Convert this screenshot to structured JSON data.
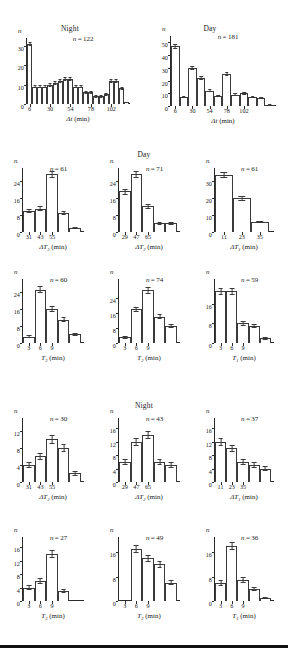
{
  "figure": {
    "section_headers": [
      {
        "label": "Night",
        "row": 1,
        "side": "left"
      },
      {
        "label": "Day",
        "row": 1,
        "side": "right"
      },
      {
        "label": "Day",
        "row": 2
      },
      {
        "label": "Night",
        "row": 4
      }
    ],
    "axis_n_symbol": "n",
    "minutes_unit": "(min)"
  },
  "chart_data": [
    {
      "id": "r1c1",
      "type": "bar",
      "title": "Night",
      "n_label": "n = 122",
      "n_value": 122,
      "xlabel": "Δt (min)",
      "ylabel": "n",
      "ylim": [
        0,
        34
      ],
      "yticks": [
        0,
        10,
        20,
        30
      ],
      "xticks": [
        6,
        30,
        54,
        78,
        102
      ],
      "bin_count": 13,
      "categories": [
        "6",
        "12",
        "18",
        "24",
        "30",
        "36",
        "42",
        "48",
        "54",
        "60",
        "66",
        "72",
        "78",
        "84",
        "90",
        "96",
        "102",
        "108",
        "114"
      ],
      "values": [
        31,
        9,
        9,
        9,
        10,
        11,
        12,
        13,
        13,
        9,
        9,
        6,
        6,
        4,
        4,
        5,
        12,
        12,
        8,
        1
      ],
      "errors": [
        1.2,
        0.8,
        0.8,
        0.8,
        0.9,
        0.9,
        1.0,
        1.0,
        1.0,
        0.9,
        0.9,
        0.7,
        0.7,
        0.6,
        0.6,
        0.7,
        1.0,
        1.0,
        0.9,
        0.3
      ],
      "grid": false
    },
    {
      "id": "r1c2",
      "type": "bar",
      "title": "Day",
      "n_label": "n = 181",
      "n_value": 181,
      "xlabel": "Δt (min)",
      "ylabel": "n",
      "ylim": [
        0,
        55
      ],
      "yticks": [
        0,
        10,
        20,
        30,
        40,
        50
      ],
      "xticks": [
        6,
        30,
        54,
        78,
        102
      ],
      "bin_count": 11,
      "categories": [
        "6",
        "18",
        "30",
        "42",
        "54",
        "66",
        "78",
        "90",
        "102",
        "114",
        "126"
      ],
      "values": [
        47,
        7,
        30,
        22,
        12,
        8,
        25,
        9,
        10,
        7,
        6,
        1
      ],
      "errors": [
        2.0,
        0.8,
        1.6,
        1.4,
        1.0,
        0.8,
        1.5,
        0.9,
        1.0,
        0.8,
        0.7,
        0.3
      ],
      "grid": false
    },
    {
      "id": "r2c1",
      "type": "bar",
      "title": "",
      "n_label": "n = 61",
      "n_value": 61,
      "xlabel": "ΔT₃ (min)",
      "ylabel": "n",
      "ylim": [
        0,
        30
      ],
      "yticks": [
        0,
        8,
        16,
        24
      ],
      "xticks": [
        31,
        43,
        55
      ],
      "bin_count": 5,
      "categories": [
        "31",
        "43",
        "55",
        "67",
        "79"
      ],
      "values": [
        10,
        11,
        27,
        9,
        2
      ],
      "errors": [
        1.0,
        1.1,
        1.6,
        1.0,
        0.5
      ],
      "grid": false
    },
    {
      "id": "r2c2",
      "type": "bar",
      "title": "Day",
      "n_label": "n = 71",
      "n_value": 71,
      "xlabel": "ΔT₂ (min)",
      "ylabel": "n",
      "ylim": [
        0,
        30
      ],
      "yticks": [
        0,
        8,
        16,
        24
      ],
      "xticks": [
        29,
        47,
        65
      ],
      "bin_count": 5,
      "categories": [
        "29",
        "47",
        "65",
        "83",
        "101"
      ],
      "values": [
        19,
        27,
        12,
        4,
        4
      ],
      "errors": [
        1.4,
        1.7,
        1.1,
        0.6,
        0.6
      ],
      "grid": false
    },
    {
      "id": "r2c3",
      "type": "bar",
      "title": "",
      "n_label": "n = 61",
      "n_value": 61,
      "xlabel": "ΔT₁ (min)",
      "ylabel": "n",
      "ylim": [
        0,
        38
      ],
      "yticks": [
        0,
        10,
        20,
        30
      ],
      "xticks": [
        11,
        23,
        35
      ],
      "bin_count": 3,
      "categories": [
        "11",
        "23",
        "35"
      ],
      "values": [
        34,
        20,
        6
      ],
      "errors": [
        1.8,
        1.4,
        0.8
      ],
      "grid": false
    },
    {
      "id": "r3c1",
      "type": "bar",
      "title": "",
      "n_label": "n = 60",
      "n_value": 60,
      "xlabel": "T₃ (min)",
      "ylabel": "n",
      "ylim": [
        0,
        30
      ],
      "yticks": [
        0,
        8,
        16,
        24
      ],
      "xticks": [
        3,
        6,
        9
      ],
      "bin_count": 5,
      "categories": [
        "3",
        "6",
        "9",
        "12",
        "15"
      ],
      "values": [
        3,
        25,
        16,
        11,
        4
      ],
      "errors": [
        0.6,
        1.6,
        1.2,
        1.1,
        0.7
      ],
      "grid": false
    },
    {
      "id": "r3c2",
      "type": "bar",
      "title": "",
      "n_label": "n = 74",
      "n_value": 74,
      "xlabel": "T₂ (min)",
      "ylabel": "n",
      "ylim": [
        0,
        34
      ],
      "yticks": [
        0,
        8,
        16,
        24
      ],
      "xticks": [
        3,
        6,
        9
      ],
      "bin_count": 5,
      "categories": [
        "3",
        "6",
        "9",
        "12",
        "15"
      ],
      "values": [
        3,
        18,
        28,
        14,
        9
      ],
      "errors": [
        0.6,
        1.3,
        1.7,
        1.2,
        1.0
      ],
      "grid": false
    },
    {
      "id": "r3c3",
      "type": "bar",
      "title": "",
      "n_label": "n = 59",
      "n_value": 59,
      "xlabel": "T₁ (min)",
      "ylabel": "n",
      "ylim": [
        0,
        26
      ],
      "yticks": [
        0,
        8,
        16
      ],
      "xticks": [
        3,
        6,
        9
      ],
      "bin_count": 5,
      "categories": [
        "3",
        "6",
        "9",
        "12",
        "15"
      ],
      "values": [
        21,
        21,
        8,
        7,
        2
      ],
      "errors": [
        1.4,
        1.4,
        0.9,
        0.9,
        0.5
      ],
      "grid": false
    },
    {
      "id": "r4c1",
      "type": "bar",
      "title": "Night",
      "n_label": "n = 30",
      "n_value": 30,
      "xlabel": "ΔT₃ (min)",
      "ylabel": "n",
      "ylim": [
        0,
        15
      ],
      "yticks": [
        0,
        4,
        8,
        12
      ],
      "xticks": [
        31,
        43,
        55
      ],
      "bin_count": 5,
      "categories": [
        "31",
        "43",
        "55",
        "67",
        "79"
      ],
      "values": [
        4,
        6,
        10,
        8,
        2
      ],
      "errors": [
        0.7,
        0.9,
        1.1,
        1.0,
        0.5
      ],
      "grid": false
    },
    {
      "id": "r4c2",
      "type": "bar",
      "title": "",
      "n_label": "n = 43",
      "n_value": 43,
      "xlabel": "ΔT₂ (min)",
      "ylabel": "n",
      "ylim": [
        0,
        19
      ],
      "yticks": [
        0,
        4,
        8,
        12,
        16
      ],
      "xticks": [
        29,
        47,
        65
      ],
      "bin_count": 5,
      "categories": [
        "29",
        "47",
        "65",
        "83",
        "101"
      ],
      "values": [
        6,
        12,
        14,
        6,
        5
      ],
      "errors": [
        0.8,
        1.1,
        1.2,
        0.8,
        0.8
      ],
      "grid": false
    },
    {
      "id": "r4c3",
      "type": "bar",
      "title": "",
      "n_label": "n = 37",
      "n_value": 37,
      "xlabel": "ΔT₁ (min)",
      "ylabel": "n",
      "ylim": [
        0,
        19
      ],
      "yticks": [
        0,
        4,
        8,
        12,
        16
      ],
      "xticks": [
        11,
        23,
        35
      ],
      "bin_count": 5,
      "categories": [
        "11",
        "23",
        "35",
        "47",
        "59"
      ],
      "values": [
        12,
        10,
        6,
        5,
        4
      ],
      "errors": [
        1.1,
        1.0,
        0.8,
        0.8,
        0.7
      ],
      "grid": false
    },
    {
      "id": "r5c1",
      "type": "bar",
      "title": "",
      "n_label": "n = 27",
      "n_value": 27,
      "xlabel": "T₃ (min)",
      "ylabel": "n",
      "ylim": [
        0,
        19
      ],
      "yticks": [
        0,
        4,
        8,
        12,
        16
      ],
      "xticks": [
        3,
        6,
        9
      ],
      "bin_count": 5,
      "categories": [
        "3",
        "6",
        "9",
        "12",
        "15"
      ],
      "values": [
        4,
        6,
        14,
        3,
        0
      ],
      "errors": [
        0.7,
        0.9,
        1.2,
        0.6,
        0
      ],
      "grid": false
    },
    {
      "id": "r5c2",
      "type": "bar",
      "title": "",
      "n_label": "n = 49",
      "n_value": 49,
      "xlabel": "T₂ (min)",
      "ylabel": "n",
      "ylim": [
        0,
        21
      ],
      "yticks": [
        0,
        8,
        16
      ],
      "xticks": [
        3,
        6,
        9
      ],
      "bin_count": 5,
      "categories": [
        "3",
        "6",
        "9",
        "12",
        "15"
      ],
      "values": [
        0,
        17,
        14,
        12,
        6
      ],
      "errors": [
        0,
        1.3,
        1.2,
        1.1,
        0.8
      ],
      "grid": false
    },
    {
      "id": "r5c3",
      "type": "bar",
      "title": "",
      "n_label": "n = 36",
      "n_value": 36,
      "xlabel": "T₁ (min)",
      "ylabel": "n",
      "ylim": [
        0,
        21
      ],
      "yticks": [
        0,
        8,
        16
      ],
      "xticks": [
        3,
        6,
        9
      ],
      "bin_count": 5,
      "categories": [
        "3",
        "6",
        "9",
        "12",
        "15"
      ],
      "values": [
        6,
        18,
        7,
        4,
        1
      ],
      "errors": [
        0.9,
        1.3,
        0.9,
        0.7,
        0.4
      ],
      "grid": false
    }
  ]
}
